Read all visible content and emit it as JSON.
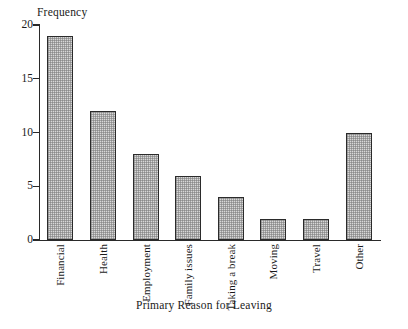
{
  "chart_data": {
    "type": "bar",
    "title": "",
    "categories": [
      "Financial",
      "Health",
      "Employment",
      "Family issues",
      "Taking a break",
      "Moving",
      "Travel",
      "Other"
    ],
    "values": [
      19,
      12,
      8,
      6,
      4,
      2,
      2,
      10
    ],
    "xlabel": "Primary Reason for Leaving",
    "ylabel": "Frequency",
    "ylim": [
      0,
      20
    ],
    "yticks": [
      0,
      5,
      10,
      15,
      20
    ],
    "ytick_labels": [
      "0",
      "5",
      "10",
      "15",
      "20"
    ],
    "grid": false,
    "legend": false,
    "bar_fill_color": "#d8d8d8",
    "bar_edge_color": "#2b2b2b",
    "axis_color": "#2a2a2a",
    "background_color": "#ffffff",
    "xtick_label_rotation": 90
  }
}
